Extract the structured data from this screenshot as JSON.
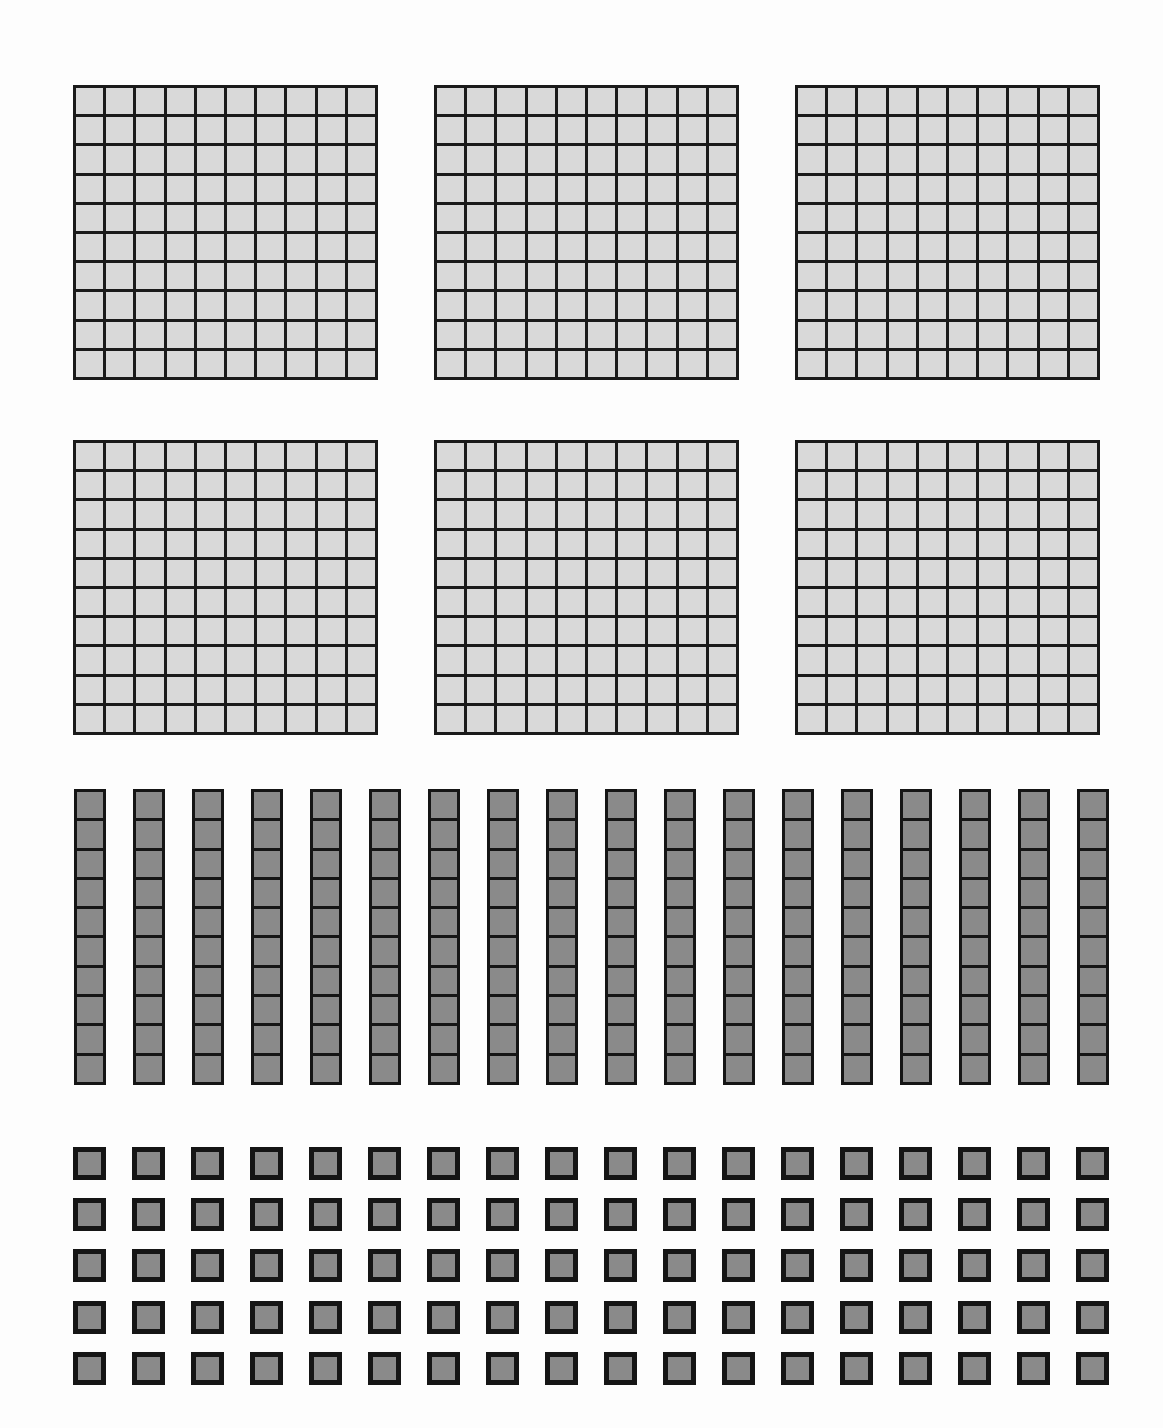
{
  "document": {
    "title": "Base-Ten Blocks Place Value Set",
    "background_color": "#fdfdfd"
  },
  "colors": {
    "flat_cell_fill": "#d9d9d9",
    "flat_line": "#1a1a1a",
    "rod_cell_fill": "#8a8a8a",
    "rod_line": "#151515",
    "unit_fill": "#8a8a8a",
    "unit_line": "#151515"
  },
  "groups": [
    {
      "name": "hundreds-flats",
      "piece_label": "flat",
      "piece_value": 100,
      "count": 6,
      "rows_of_cells": 10,
      "cols_of_cells": 10,
      "total_value": 600,
      "layout": {
        "rows": 2,
        "cols": 3,
        "x_start": 73,
        "y_start": 85,
        "width": 305,
        "height": 295,
        "x_step": 361,
        "y_step": 355
      }
    },
    {
      "name": "tens-rods",
      "piece_label": "rod",
      "piece_value": 10,
      "count": 18,
      "cells_per_rod": 10,
      "total_value": 180,
      "layout": {
        "x_start": 74,
        "y_start": 789,
        "width": 32,
        "height": 296,
        "x_step": 59.0
      }
    },
    {
      "name": "ones-units",
      "piece_label": "unit",
      "piece_value": 1,
      "count": 90,
      "total_value": 90,
      "layout": {
        "rows": 5,
        "cols": 18,
        "x_start": 73,
        "y_start": 1147,
        "size": 33,
        "x_step": 59.0,
        "y_step": 51.2
      }
    }
  ],
  "chart_data": {
    "type": "table",
    "categories": [
      "Hundreds (flats)",
      "Tens (rods)",
      "Ones (units)"
    ],
    "values": [
      6,
      18,
      90
    ],
    "place_values": [
      100,
      10,
      1
    ],
    "subtotals": [
      600,
      180,
      90
    ],
    "total": 870,
    "xlabel": "Place value group",
    "ylabel": "Number of blocks"
  }
}
